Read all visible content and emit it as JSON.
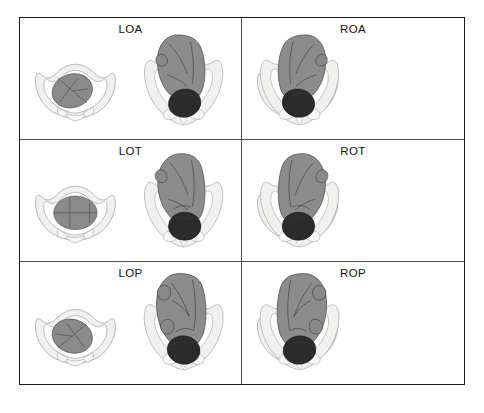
{
  "figure": {
    "columns": 2,
    "rows": 3,
    "border_color": "#1b1b1b",
    "divider_color": "#4a4a4a",
    "background": "#ffffff"
  },
  "colors": {
    "fetal_body": "#8c8c8c",
    "fetal_head_engaged": "#2b2b2b",
    "fetal_head_inlet": "#8a8a8a",
    "pelvis_bone": "#f0f0ee",
    "pelvis_outline": "#9a9a9a",
    "label_text": "#111111"
  },
  "panels": [
    {
      "label": "LOA",
      "position_name": "Left occiput anterior",
      "side": "left",
      "occiput": "anterior",
      "suture_orientation": "oblique-right-down",
      "row": 1,
      "col": 1
    },
    {
      "label": "ROA",
      "position_name": "Right occiput anterior",
      "side": "right",
      "occiput": "anterior",
      "suture_orientation": "oblique-left-down",
      "row": 1,
      "col": 2
    },
    {
      "label": "LOT",
      "position_name": "Left occiput transverse",
      "side": "left",
      "occiput": "transverse",
      "suture_orientation": "horizontal",
      "row": 2,
      "col": 1
    },
    {
      "label": "ROT",
      "position_name": "Right occiput transverse",
      "side": "right",
      "occiput": "transverse",
      "suture_orientation": "horizontal",
      "row": 2,
      "col": 2
    },
    {
      "label": "LOP",
      "position_name": "Left occiput posterior",
      "side": "left",
      "occiput": "posterior",
      "suture_orientation": "oblique-left-down",
      "row": 3,
      "col": 1
    },
    {
      "label": "ROP",
      "position_name": "Right occiput posterior",
      "side": "right",
      "occiput": "posterior",
      "suture_orientation": "oblique-right-down",
      "row": 3,
      "col": 2
    }
  ]
}
